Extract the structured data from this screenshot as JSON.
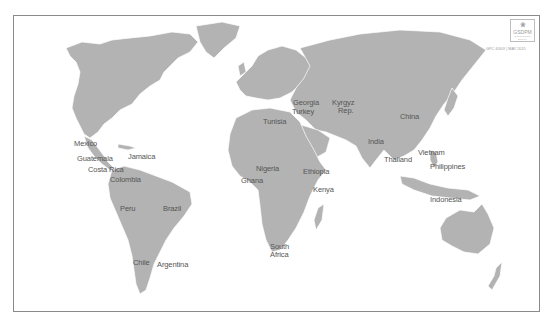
{
  "map": {
    "type": "world-political-outline",
    "land_color": "#b3b3b3",
    "border_color": "#ffffff",
    "background_color": "#ffffff",
    "frame_color": "#8a8a8a",
    "label_color": "#555555"
  },
  "logo": {
    "icon": "people-cluster-icon",
    "text": "GSDPM",
    "subtext": "Global Service Delivery"
  },
  "doc_reference": "GPC 4/00X | MAY 2015",
  "country_labels": [
    {
      "name": "Mexico",
      "x": 74,
      "y": 140
    },
    {
      "name": "Guatemala",
      "x": 77,
      "y": 155
    },
    {
      "name": "Jamaica",
      "x": 128,
      "y": 153
    },
    {
      "name": "Costa Rica",
      "x": 88,
      "y": 166
    },
    {
      "name": "Colombia",
      "x": 110,
      "y": 176
    },
    {
      "name": "Peru",
      "x": 120,
      "y": 205
    },
    {
      "name": "Brazil",
      "x": 163,
      "y": 205
    },
    {
      "name": "Chile",
      "x": 133,
      "y": 259
    },
    {
      "name": "Argentina",
      "x": 157,
      "y": 261
    },
    {
      "name": "Tunisia",
      "x": 263,
      "y": 118
    },
    {
      "name": "Georgia",
      "x": 293,
      "y": 99
    },
    {
      "name": "Turkey",
      "x": 292,
      "y": 108
    },
    {
      "name": "Kyrgyz",
      "x": 332,
      "y": 99
    },
    {
      "name": "Rep.",
      "x": 338,
      "y": 107
    },
    {
      "name": "China",
      "x": 400,
      "y": 113
    },
    {
      "name": "India",
      "x": 368,
      "y": 138
    },
    {
      "name": "Thailand",
      "x": 384,
      "y": 156
    },
    {
      "name": "Vietnam",
      "x": 418,
      "y": 149
    },
    {
      "name": "Philippines",
      "x": 430,
      "y": 163
    },
    {
      "name": "Nigeria",
      "x": 256,
      "y": 165
    },
    {
      "name": "Ghana",
      "x": 241,
      "y": 177
    },
    {
      "name": "Ethiopia",
      "x": 303,
      "y": 168
    },
    {
      "name": "Kenya",
      "x": 313,
      "y": 186
    },
    {
      "name": "Indonesia",
      "x": 430,
      "y": 196
    },
    {
      "name": "South",
      "x": 270,
      "y": 243
    },
    {
      "name": "Africa",
      "x": 270,
      "y": 251
    }
  ]
}
